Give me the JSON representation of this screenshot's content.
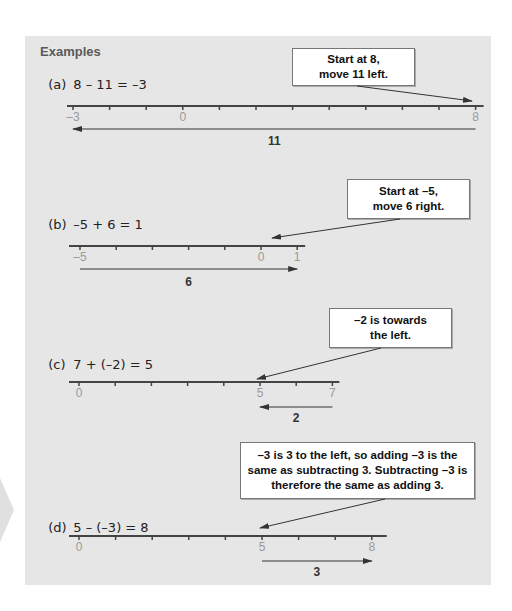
{
  "heading": "Examples",
  "colors": {
    "panel_background": "#e6e6e6",
    "number_line": "#444444",
    "tick_label": "#9a9a9a",
    "callout_background": "#ffffff"
  },
  "examples": [
    {
      "label": "(a)",
      "equation": "8 – 11 = –3",
      "callout": "Start at 8,\nmove 11 left.",
      "line": {
        "min": -3,
        "max": 8,
        "labels": [
          -3,
          0,
          8
        ],
        "labels_text": [
          "–3",
          "0",
          "8"
        ]
      },
      "move": {
        "from": 8,
        "to": -3,
        "label": "11"
      }
    },
    {
      "label": "(b)",
      "equation": "–5 + 6 = 1",
      "callout": "Start at –5,\nmove 6 right.",
      "line": {
        "min": -5,
        "max": 1,
        "labels": [
          -5,
          0,
          1
        ],
        "labels_text": [
          "–5",
          "0",
          "1"
        ]
      },
      "move": {
        "from": -5,
        "to": 1,
        "label": "6"
      }
    },
    {
      "label": "(c)",
      "equation": "7 + (–2) = 5",
      "callout": "–2 is towards\nthe left.",
      "line": {
        "min": 0,
        "max": 7,
        "labels": [
          0,
          5,
          7
        ],
        "labels_text": [
          "0",
          "5",
          "7"
        ]
      },
      "move": {
        "from": 7,
        "to": 5,
        "label": "2"
      }
    },
    {
      "label": "(d)",
      "equation": "5 – (–3) = 8",
      "callout": "–3 is 3 to the left, so adding –3 is the\nsame as subtracting 3. Subtracting –3 is\ntherefore the same as adding 3.",
      "line": {
        "min": 0,
        "max": 8,
        "labels": [
          0,
          5,
          8
        ],
        "labels_text": [
          "0",
          "5",
          "8"
        ]
      },
      "move": {
        "from": 5,
        "to": 8,
        "label": "3"
      }
    }
  ]
}
